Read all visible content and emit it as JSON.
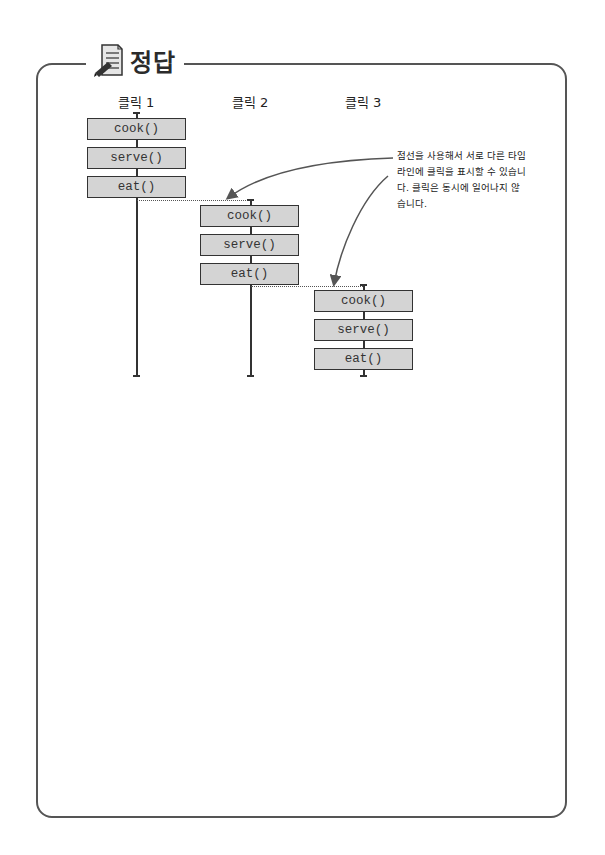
{
  "header": {
    "title": "정답",
    "icon": "notepad-pencil-icon"
  },
  "diagram": {
    "columns": [
      {
        "label": "클릭 1",
        "steps": [
          "cook()",
          "serve()",
          "eat()"
        ]
      },
      {
        "label": "클릭 2",
        "steps": [
          "cook()",
          "serve()",
          "eat()"
        ]
      },
      {
        "label": "클릭 3",
        "steps": [
          "cook()",
          "serve()",
          "eat()"
        ]
      }
    ],
    "annotation": "점선을 사용해서 서로 다른 타임라인에 클릭을 표시할 수 있습니다. 클릭은 동시에 일어나지 않습니다."
  },
  "colors": {
    "box_fill": "#d4d4d4",
    "stroke": "#333333",
    "frame": "#555555",
    "arrow": "#555555"
  }
}
